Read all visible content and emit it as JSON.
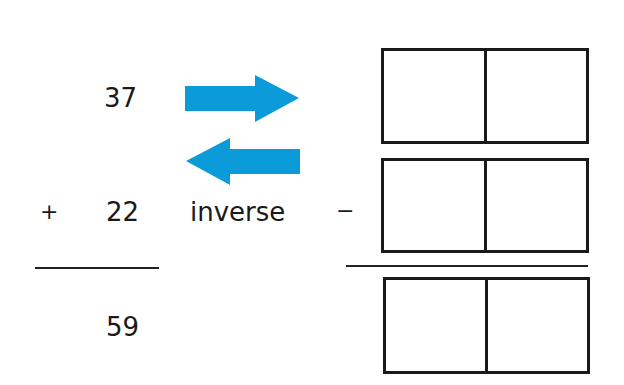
{
  "addition": {
    "addend1": "37",
    "operator": "+",
    "addend2": "22",
    "sum": "59"
  },
  "label": "inverse",
  "arrows": {
    "forward": "arrow-right-icon",
    "backward": "arrow-left-icon",
    "color": "#0a9bd8"
  },
  "subtraction": {
    "operator": "−",
    "rows": [
      {
        "cells": [
          "",
          ""
        ]
      },
      {
        "cells": [
          "",
          ""
        ]
      },
      {
        "cells": [
          "",
          ""
        ]
      }
    ]
  }
}
